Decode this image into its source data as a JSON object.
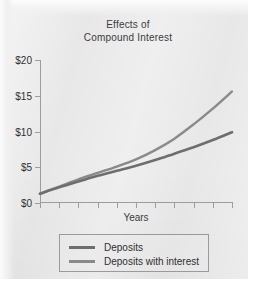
{
  "chart_data": {
    "type": "line",
    "title": "Effects of Compound Interest",
    "title_lines": [
      "Effects of",
      "Compound Interest"
    ],
    "xlabel": "Years",
    "ylabel": "",
    "grid": false,
    "legend_position": "bottom",
    "ylim": [
      0,
      20
    ],
    "yticks": [
      0,
      5,
      10,
      15,
      20
    ],
    "ytick_labels": [
      "$0",
      "$5",
      "$10",
      "$15",
      "$20"
    ],
    "xlim": [
      0,
      10
    ],
    "xticks": [
      0,
      1,
      2,
      3,
      4,
      5,
      6,
      7,
      8,
      9,
      10
    ],
    "xtick_labels": [
      "",
      "",
      "",
      "",
      "",
      "",
      "",
      "",
      "",
      "",
      ""
    ],
    "x": [
      0,
      1,
      2,
      3,
      4,
      5,
      6,
      7,
      8,
      9,
      10
    ],
    "series": [
      {
        "name": "Deposits",
        "color": "#6e6e6e",
        "values": [
          1.3,
          2.2,
          3.0,
          3.8,
          4.5,
          5.2,
          6.0,
          6.9,
          7.8,
          8.8,
          9.9
        ]
      },
      {
        "name": "Deposits with interest",
        "color": "#8a8a8a",
        "values": [
          1.3,
          2.3,
          3.3,
          4.2,
          5.1,
          6.1,
          7.4,
          9.0,
          11.0,
          13.2,
          15.6
        ]
      }
    ]
  },
  "chart": {
    "title": {
      "line1": "Effects of",
      "line2": "Compound Interest"
    },
    "y_axis": {
      "labels": [
        "$20",
        "$15",
        "$10",
        "$5",
        "$0"
      ]
    },
    "x_axis": {
      "title": "Years"
    },
    "legend": {
      "items": [
        {
          "label": "Deposits",
          "color": "#6e6e6e"
        },
        {
          "label": "Deposits with interest",
          "color": "#8a8a8a"
        }
      ]
    }
  }
}
